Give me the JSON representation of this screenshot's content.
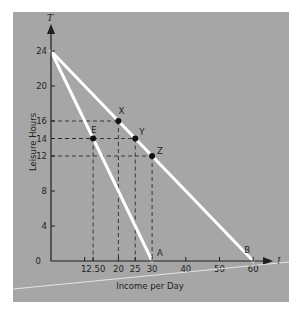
{
  "chart_data": {
    "type": "line",
    "title": "",
    "xlabel": "Income per Day",
    "ylabel": "Leisure Hours",
    "x_axis_symbol": "I",
    "y_axis_symbol": "T",
    "xlim": [
      0,
      65
    ],
    "ylim": [
      0,
      25
    ],
    "x_ticks": [
      {
        "value": 10,
        "label": ""
      },
      {
        "value": 12.5,
        "label": "12.50"
      },
      {
        "value": 20,
        "label": "20"
      },
      {
        "value": 25,
        "label": "25"
      },
      {
        "value": 30,
        "label": "30"
      },
      {
        "value": 40,
        "label": "40"
      },
      {
        "value": 50,
        "label": "50"
      },
      {
        "value": 60,
        "label": "60"
      }
    ],
    "y_ticks": [
      {
        "value": 0,
        "label": "0"
      },
      {
        "value": 4,
        "label": "4"
      },
      {
        "value": 8,
        "label": "8"
      },
      {
        "value": 12,
        "label": "12"
      },
      {
        "value": 14,
        "label": "14"
      },
      {
        "value": 16,
        "label": "16"
      },
      {
        "value": 20,
        "label": "20"
      },
      {
        "value": 24,
        "label": "24"
      }
    ],
    "series": [
      {
        "name": "Budget line A",
        "points": [
          [
            0,
            24
          ],
          [
            30,
            0
          ]
        ],
        "end_label": "A"
      },
      {
        "name": "Budget line B",
        "points": [
          [
            0,
            24
          ],
          [
            60,
            0
          ]
        ],
        "end_label": "B"
      }
    ],
    "points": [
      {
        "label": "E",
        "x": 12.5,
        "y": 14
      },
      {
        "label": "X",
        "x": 20,
        "y": 16
      },
      {
        "label": "Y",
        "x": 25,
        "y": 14
      },
      {
        "label": "Z",
        "x": 30,
        "y": 12
      }
    ],
    "grid": false,
    "legend": null
  },
  "colors": {
    "panel": "#a6a6a6",
    "lines": "#ffffff",
    "axis": "#1f1f1f"
  }
}
